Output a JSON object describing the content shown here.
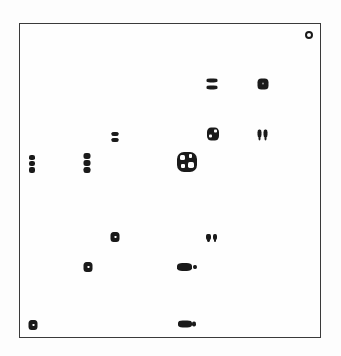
{
  "chart_data": {
    "type": "scatter",
    "title": "",
    "xlabel": "",
    "ylabel": "",
    "grid": false,
    "legend": null,
    "frame": {
      "left": 19,
      "top": 23,
      "right": 321,
      "bottom": 338
    },
    "points": [
      {
        "id": "p1",
        "x": 309,
        "y": 35,
        "shape": "ring",
        "w": 8,
        "h": 8
      },
      {
        "id": "p2",
        "x": 212,
        "y": 84,
        "shape": "pair-h",
        "w": 11,
        "h": 11
      },
      {
        "id": "p3",
        "x": 263,
        "y": 84,
        "shape": "square",
        "w": 11,
        "h": 11
      },
      {
        "id": "p4",
        "x": 213,
        "y": 134,
        "shape": "grid",
        "w": 12,
        "h": 13
      },
      {
        "id": "p5",
        "x": 263,
        "y": 135,
        "shape": "pair-v",
        "w": 11,
        "h": 11
      },
      {
        "id": "p6",
        "x": 115,
        "y": 137,
        "shape": "pair-h",
        "w": 7,
        "h": 10
      },
      {
        "id": "p7",
        "x": 32,
        "y": 164,
        "shape": "column",
        "w": 6,
        "h": 18
      },
      {
        "id": "p8",
        "x": 87,
        "y": 163,
        "shape": "column",
        "w": 7,
        "h": 20
      },
      {
        "id": "p9",
        "x": 187,
        "y": 162,
        "shape": "big-grid",
        "w": 20,
        "h": 20
      },
      {
        "id": "p10",
        "x": 115,
        "y": 237,
        "shape": "square",
        "w": 9,
        "h": 10
      },
      {
        "id": "p11",
        "x": 212,
        "y": 238,
        "shape": "pair-v",
        "w": 12,
        "h": 8
      },
      {
        "id": "p12",
        "x": 88,
        "y": 267,
        "shape": "square",
        "w": 9,
        "h": 10
      },
      {
        "id": "p13",
        "x": 187,
        "y": 267,
        "shape": "wide",
        "w": 20,
        "h": 8
      },
      {
        "id": "p14",
        "x": 33,
        "y": 325,
        "shape": "square",
        "w": 9,
        "h": 10
      },
      {
        "id": "p15",
        "x": 187,
        "y": 324,
        "shape": "wide",
        "w": 18,
        "h": 7
      }
    ]
  }
}
